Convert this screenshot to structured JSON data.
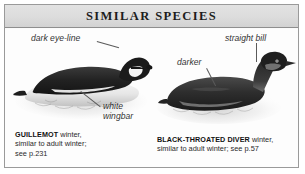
{
  "header": {
    "title": "SIMILAR SPECIES"
  },
  "plate": {
    "figures": [
      {
        "id": "guillemot",
        "species_label": "GUILLEMOT",
        "caption_rest": " winter,",
        "caption_line2": "similar to adult winter;",
        "caption_line3": "see p.231",
        "annotations": [
          {
            "name": "dark-eye-line",
            "text": "dark eye-line"
          },
          {
            "name": "white-wingbar",
            "text": "white wingbar"
          }
        ]
      },
      {
        "id": "black-throated-diver",
        "species_label": "BLACK-THROATED DIVER",
        "caption_rest": " winter,",
        "caption_line2": "similar to adult winter; see p.57",
        "annotations": [
          {
            "name": "straight-bill",
            "text": "straight bill"
          },
          {
            "name": "darker",
            "text": "darker"
          }
        ]
      }
    ]
  },
  "colors": {
    "panel_border": "#9a9a9a",
    "header_background": "#dcdcdc",
    "header_text": "#1c1c1c",
    "plate_background": "#fdfdfd",
    "label_text": "#333333",
    "leader_line": "#5a5a5a",
    "caption_text": "#2a2a2a",
    "bird_dark": "#2b2b2b",
    "bird_light": "#efefef"
  }
}
